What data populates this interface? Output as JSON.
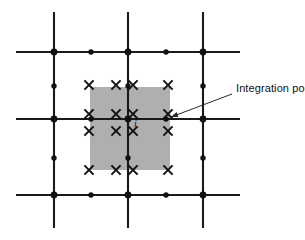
{
  "figure": {
    "background_color": "#ffffff",
    "line_color": "#1a1a1a",
    "shade_color": "#a8a8a8",
    "width": 305,
    "height": 240
  },
  "annotation": {
    "label": "Integration point",
    "label_x": 236,
    "label_y": 92,
    "arrow_from_x": 232,
    "arrow_from_y": 94,
    "arrow_to_x": 171,
    "arrow_to_y": 117
  },
  "element_label": {
    "text": "i",
    "x": 134,
    "y": 127
  },
  "mesh": {
    "vertical_lines": [
      {
        "x": 54,
        "y1": 12,
        "y2": 228
      },
      {
        "x": 128,
        "y1": 12,
        "y2": 228
      },
      {
        "x": 203,
        "y1": 12,
        "y2": 228
      }
    ],
    "horizontal_lines": [
      {
        "y": 52,
        "x1": 16,
        "x2": 240
      },
      {
        "y": 119,
        "x1": 16,
        "x2": 240
      },
      {
        "y": 195,
        "x1": 16,
        "x2": 240
      }
    ],
    "corner_nodes": [
      {
        "x": 54,
        "y": 52
      },
      {
        "x": 128,
        "y": 52
      },
      {
        "x": 203,
        "y": 52
      },
      {
        "x": 54,
        "y": 119
      },
      {
        "x": 128,
        "y": 119
      },
      {
        "x": 203,
        "y": 119
      },
      {
        "x": 54,
        "y": 195
      },
      {
        "x": 128,
        "y": 195
      },
      {
        "x": 203,
        "y": 195
      }
    ],
    "midside_nodes": [
      {
        "x": 91,
        "y": 52
      },
      {
        "x": 166,
        "y": 52
      },
      {
        "x": 91,
        "y": 119
      },
      {
        "x": 166,
        "y": 119
      },
      {
        "x": 91,
        "y": 195
      },
      {
        "x": 166,
        "y": 195
      },
      {
        "x": 54,
        "y": 86
      },
      {
        "x": 128,
        "y": 86
      },
      {
        "x": 203,
        "y": 86
      },
      {
        "x": 54,
        "y": 158
      },
      {
        "x": 128,
        "y": 158
      },
      {
        "x": 203,
        "y": 158
      }
    ],
    "corner_node_radius": 3.4,
    "midside_node_radius": 2.7
  },
  "shaded_region": {
    "x": 90,
    "y": 87,
    "width": 80,
    "height": 83
  },
  "integration_points": {
    "columns_x": [
      89,
      116,
      133,
      168
    ],
    "rows_y": [
      85,
      114,
      131,
      170
    ],
    "mark_size": 4.6,
    "count": 16
  }
}
